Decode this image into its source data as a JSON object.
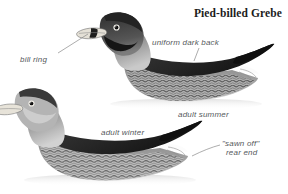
{
  "plate": {
    "title": "Pied-billed Grebe",
    "subject": "Pied-billed Grebe",
    "medium": "grayscale field-guide illustration",
    "background_color": "#ffffff",
    "ink_color": "#2a2a2a",
    "label_color": "#55595c",
    "width": 288,
    "height": 194
  },
  "annotations": [
    {
      "id": "bill-ring",
      "text": "bill ring",
      "points_to": "bill of adult summer bird",
      "leader": true
    },
    {
      "id": "uniform-dark-back",
      "text": "uniform dark back",
      "points_to": "back of adult summer bird",
      "leader": true
    },
    {
      "id": "adult-summer",
      "text": "adult summer",
      "points_to": "upper bird",
      "leader": false
    },
    {
      "id": "adult-winter",
      "text": "adult winter",
      "points_to": "lower bird",
      "leader": false
    },
    {
      "id": "sawn-off-rear-end",
      "line1": "\"sawn off\"",
      "line2": "rear end",
      "points_to": "rear end of adult winter bird",
      "leader": true
    }
  ],
  "figures": [
    {
      "id": "adult-summer-bird",
      "label": "adult summer",
      "pose": "swimming, facing left",
      "traits": [
        "pale bill with bold dark vertical ring",
        "black chin and throat patch",
        "dark crown",
        "uniform dark back",
        "mottled flanks",
        "pointed sawn-off rear end"
      ]
    },
    {
      "id": "adult-winter-bird",
      "label": "adult winter",
      "pose": "swimming, facing left",
      "traits": [
        "plain pale bill without ring",
        "pale buff throat",
        "dark crown",
        "uniform dark back",
        "mottled flanks",
        "pointed sawn-off rear end"
      ]
    }
  ]
}
